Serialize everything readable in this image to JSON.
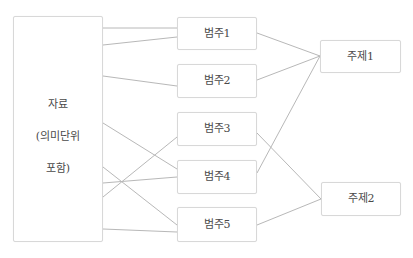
{
  "diagram": {
    "type": "flow-mapping",
    "source": {
      "id": "data",
      "lines": [
        "자료",
        "(의미단위",
        "포함)"
      ],
      "box": {
        "x": 13,
        "y": 16,
        "w": 90,
        "h": 226
      }
    },
    "categories": [
      {
        "id": "cat1",
        "label": "범주1",
        "box": {
          "x": 177,
          "y": 17,
          "w": 80,
          "h": 33
        }
      },
      {
        "id": "cat2",
        "label": "범주2",
        "box": {
          "x": 177,
          "y": 64,
          "w": 80,
          "h": 34
        }
      },
      {
        "id": "cat3",
        "label": "범주3",
        "box": {
          "x": 177,
          "y": 112,
          "w": 80,
          "h": 34
        }
      },
      {
        "id": "cat4",
        "label": "범주4",
        "box": {
          "x": 177,
          "y": 160,
          "w": 80,
          "h": 34
        }
      },
      {
        "id": "cat5",
        "label": "범주5",
        "box": {
          "x": 177,
          "y": 207,
          "w": 80,
          "h": 35
        }
      }
    ],
    "themes": [
      {
        "id": "theme1",
        "label": "주제1",
        "box": {
          "x": 320,
          "y": 40,
          "w": 81,
          "h": 33
        }
      },
      {
        "id": "theme2",
        "label": "주제2",
        "box": {
          "x": 321,
          "y": 182,
          "w": 80,
          "h": 34
        }
      }
    ],
    "edges": [
      {
        "from": "data",
        "to": "cat1",
        "x1": 103,
        "y1": 28,
        "x2": 177,
        "y2": 28
      },
      {
        "from": "data",
        "to": "cat1",
        "x1": 103,
        "y1": 45,
        "x2": 177,
        "y2": 37
      },
      {
        "from": "data",
        "to": "cat2",
        "x1": 103,
        "y1": 76,
        "x2": 177,
        "y2": 86
      },
      {
        "from": "data",
        "to": "cat4",
        "x1": 103,
        "y1": 123,
        "x2": 177,
        "y2": 169
      },
      {
        "from": "data",
        "to": "cat5",
        "x1": 103,
        "y1": 167,
        "x2": 177,
        "y2": 225
      },
      {
        "from": "data",
        "to": "cat4",
        "x1": 103,
        "y1": 183,
        "x2": 177,
        "y2": 177
      },
      {
        "from": "data",
        "to": "cat3",
        "x1": 103,
        "y1": 197,
        "x2": 177,
        "y2": 137
      },
      {
        "from": "data",
        "to": "cat5",
        "x1": 103,
        "y1": 229,
        "x2": 177,
        "y2": 232
      },
      {
        "from": "cat1",
        "to": "theme1",
        "x1": 257,
        "y1": 33,
        "x2": 320,
        "y2": 56
      },
      {
        "from": "cat2",
        "to": "theme1",
        "x1": 257,
        "y1": 80,
        "x2": 320,
        "y2": 56
      },
      {
        "from": "cat4",
        "to": "theme1",
        "x1": 257,
        "y1": 173,
        "x2": 320,
        "y2": 56
      },
      {
        "from": "cat3",
        "to": "theme2",
        "x1": 257,
        "y1": 133,
        "x2": 321,
        "y2": 199
      },
      {
        "from": "cat5",
        "to": "theme2",
        "x1": 257,
        "y1": 225,
        "x2": 321,
        "y2": 199
      }
    ],
    "colors": {
      "edge": "#b8b8b8",
      "border": "#d8d8d8",
      "text": "#4a4a4a"
    }
  }
}
